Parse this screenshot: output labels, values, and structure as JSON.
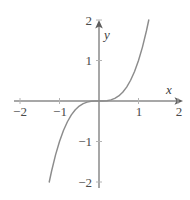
{
  "figure": {
    "background_color": "#ffffff",
    "axis_color": "#8a8a8a",
    "curve_color": "#8c8c8c",
    "label_color": "#4a4a4a"
  },
  "axes": {
    "x_axis_label": "x",
    "y_axis_label": "y",
    "x_ticks": [
      {
        "value": -2,
        "label": "−2"
      },
      {
        "value": -1,
        "label": "−1"
      },
      {
        "value": 1,
        "label": "1"
      },
      {
        "value": 2,
        "label": "2"
      }
    ],
    "y_ticks": [
      {
        "value": 2,
        "label": "2"
      },
      {
        "value": 1,
        "label": "1"
      },
      {
        "value": -1,
        "label": "−1"
      },
      {
        "value": -2,
        "label": "−2"
      }
    ]
  },
  "chart_data": {
    "type": "line",
    "title": "",
    "subtitle": "",
    "xlabel": "x",
    "ylabel": "y",
    "xlim": [
      -2,
      2
    ],
    "ylim": [
      -2,
      2
    ],
    "grid": false,
    "legend": null,
    "xticks": [
      -2,
      -1,
      1,
      2
    ],
    "yticks": [
      -2,
      -1,
      1,
      2
    ],
    "xticklabels": [
      "−2",
      "−1",
      "1",
      "2"
    ],
    "yticklabels": [
      "−2",
      "−1",
      "1",
      "2"
    ],
    "series": [
      {
        "name": "y = x³",
        "equation": "y = x^3",
        "color": "#8c8c8c",
        "x": [
          -1.26,
          -1.2,
          -1.1,
          -1.0,
          -0.9,
          -0.8,
          -0.7,
          -0.6,
          -0.5,
          -0.4,
          -0.3,
          -0.2,
          -0.1,
          0.0,
          0.1,
          0.2,
          0.3,
          0.4,
          0.5,
          0.6,
          0.7,
          0.8,
          0.9,
          1.0,
          1.1,
          1.2,
          1.26
        ],
        "y": [
          -2.0,
          -1.728,
          -1.331,
          -1.0,
          -0.729,
          -0.512,
          -0.343,
          -0.216,
          -0.125,
          -0.064,
          -0.027,
          -0.008,
          -0.001,
          0.0,
          0.001,
          0.008,
          0.027,
          0.064,
          0.125,
          0.216,
          0.343,
          0.512,
          0.729,
          1.0,
          1.331,
          1.728,
          2.0
        ]
      }
    ]
  }
}
